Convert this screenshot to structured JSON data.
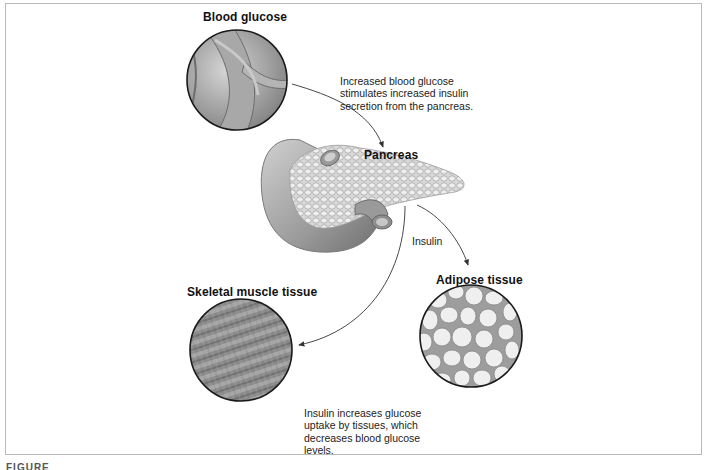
{
  "diagram": {
    "nodes": {
      "blood_glucose": {
        "label": "Blood glucose",
        "icon": "blood-vessel-illustration"
      },
      "pancreas": {
        "label": "Pancreas",
        "icon": "pancreas-illustration"
      },
      "skeletal_muscle": {
        "label": "Skeletal muscle tissue",
        "icon": "muscle-tissue-illustration"
      },
      "adipose": {
        "label": "Adipose tissue",
        "icon": "adipose-tissue-illustration"
      }
    },
    "annotations": {
      "stimulus": "Increased blood glucose\nstimulates increased insulin\nsecretion from the pancreas.",
      "insulin": "Insulin",
      "effect": "Insulin increases glucose\nuptake by tissues, which\ndecreases blood glucose\nlevels."
    },
    "edges": [
      {
        "from": "blood_glucose",
        "to": "pancreas"
      },
      {
        "from": "pancreas",
        "to": "skeletal_muscle",
        "label": "Insulin"
      },
      {
        "from": "pancreas",
        "to": "adipose",
        "label": "Insulin"
      }
    ],
    "figure_label": "FIGURE"
  },
  "colors": {
    "frame_border": "#b9b9b9",
    "tissue_gray": "#8a8a8a",
    "outline": "#1a1a1a",
    "arrow": "#333333"
  }
}
